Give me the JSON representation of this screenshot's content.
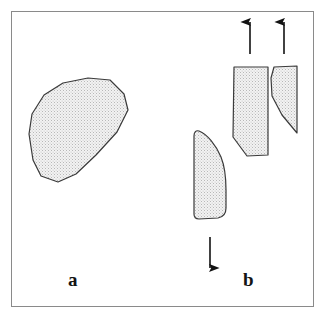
{
  "figure": {
    "background_color": "#ffffff",
    "frame": {
      "name": "figure-border",
      "color": "#8a8a8a",
      "x": 11,
      "y": 11,
      "width": 303,
      "height": 296
    },
    "style": {
      "outline_color": "#3a3a3a",
      "fill_pattern": "stipple-dots",
      "fill_base_color": "#ededed",
      "stipple_dot_color": "#b4b4b4",
      "arrow_color": "#121212"
    },
    "panels": [
      {
        "id": "a",
        "label": "a",
        "label_x": 68,
        "label_y": 270,
        "description": "intact stippled polygonal clast",
        "shapes": [
          {
            "name": "clast-intact",
            "type": "polygon",
            "points": "63,83 88,78 110,80 124,94 128,110 117,132 96,155 76,174 58,182 41,176 33,160 29,134 32,114 44,95"
          }
        ],
        "arrows": []
      },
      {
        "id": "b",
        "label": "b",
        "label_x": 243,
        "label_y": 270,
        "description": "fragmented clast with separation arrows",
        "shapes": [
          {
            "name": "fragment-lower-left",
            "type": "path",
            "path": "M 199,131 C 207,134 216,145 221,157 C 225,167 226,178 226,190 L 226,208 C 226,213 223,217 218,218 L 199,219 C 196,219 194,217 194,214 L 194,136 C 194,132 196,130 199,131 Z"
          },
          {
            "name": "fragment-upper-left",
            "type": "polygon",
            "points": "234,67 268,67 268,155 247,156 233,137"
          },
          {
            "name": "fragment-upper-right",
            "type": "polygon",
            "points": "274,67 297,66 297,133 282,115 272,96 271,78"
          }
        ],
        "arrows": [
          {
            "name": "arrow-up-left",
            "direction": "up",
            "x": 250,
            "y_tail": 54,
            "y_head": 22
          },
          {
            "name": "arrow-up-right",
            "direction": "up",
            "x": 284,
            "y_tail": 54,
            "y_head": 22
          },
          {
            "name": "arrow-down-center",
            "direction": "down",
            "x": 210,
            "y_tail": 237,
            "y_head": 268
          }
        ]
      }
    ]
  }
}
